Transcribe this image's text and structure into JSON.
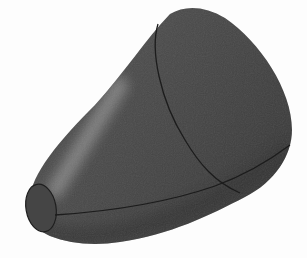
{
  "image": {
    "subject": "3D rendered tapered solid (nose cone / bullet shape)",
    "background_color": "#fdfdfd",
    "colors": {
      "body_fill": "#4a4a4a",
      "body_dark": "#3a3a3a",
      "highlight": "#8a8a8a",
      "seam_line": "#1e1e1e",
      "tip_face": "#444444"
    },
    "text": []
  }
}
